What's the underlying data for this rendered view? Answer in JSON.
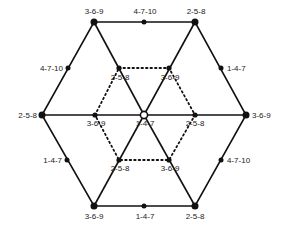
{
  "diagram": {
    "type": "hexagonal-lattice-graph",
    "colors": {
      "line": "#111111",
      "background": "#ffffff"
    },
    "center": {
      "label": "1-4-7",
      "marker": "open-circle"
    },
    "outer_vertices": [
      {
        "id": "top-left",
        "label": "3-6-9"
      },
      {
        "id": "top-right",
        "label": "2-5-8"
      },
      {
        "id": "right",
        "label": "3-6-9"
      },
      {
        "id": "bottom-right",
        "label": "2-5-8"
      },
      {
        "id": "bottom-left",
        "label": "3-6-9"
      },
      {
        "id": "left",
        "label": "2-5-8"
      }
    ],
    "outer_midpoints": [
      {
        "id": "top",
        "label": "4-7-10"
      },
      {
        "id": "upper-right",
        "label": "1-4-7"
      },
      {
        "id": "lower-right",
        "label": "4-7-10"
      },
      {
        "id": "bottom",
        "label": "1-4-7"
      },
      {
        "id": "lower-left",
        "label": "1-4-7"
      },
      {
        "id": "upper-left",
        "label": "4-7-10"
      }
    ],
    "inner_vertices": [
      {
        "id": "inner-upper-left",
        "label": "2-5-8"
      },
      {
        "id": "inner-upper-right",
        "label": "3-6-9"
      },
      {
        "id": "inner-right",
        "label": "2-5-8"
      },
      {
        "id": "inner-lower-right",
        "label": "3-6-9"
      },
      {
        "id": "inner-lower-left",
        "label": "2-5-8"
      },
      {
        "id": "inner-left",
        "label": "3-6-9"
      }
    ]
  }
}
